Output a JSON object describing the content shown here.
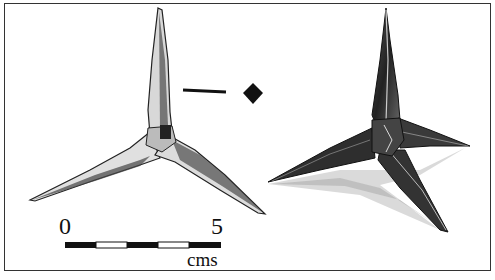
{
  "figure": {
    "objects": [
      {
        "id": "caltrop-left",
        "view": "plan view, line drawing"
      },
      {
        "id": "caltrop-right",
        "view": "perspective view with cast shadow"
      }
    ],
    "section_symbol": {
      "shape": "line and diamond",
      "meaning": "cross-section of spike is square"
    },
    "scale_bar": {
      "start_label": "0",
      "end_label": "5",
      "unit_label": "cms",
      "segments": 5,
      "segment_colors": [
        "#111111",
        "#ffffff",
        "#111111",
        "#ffffff",
        "#111111"
      ]
    },
    "colors": {
      "ink": "#111111",
      "frame": "#333333",
      "background": "#ffffff"
    }
  }
}
